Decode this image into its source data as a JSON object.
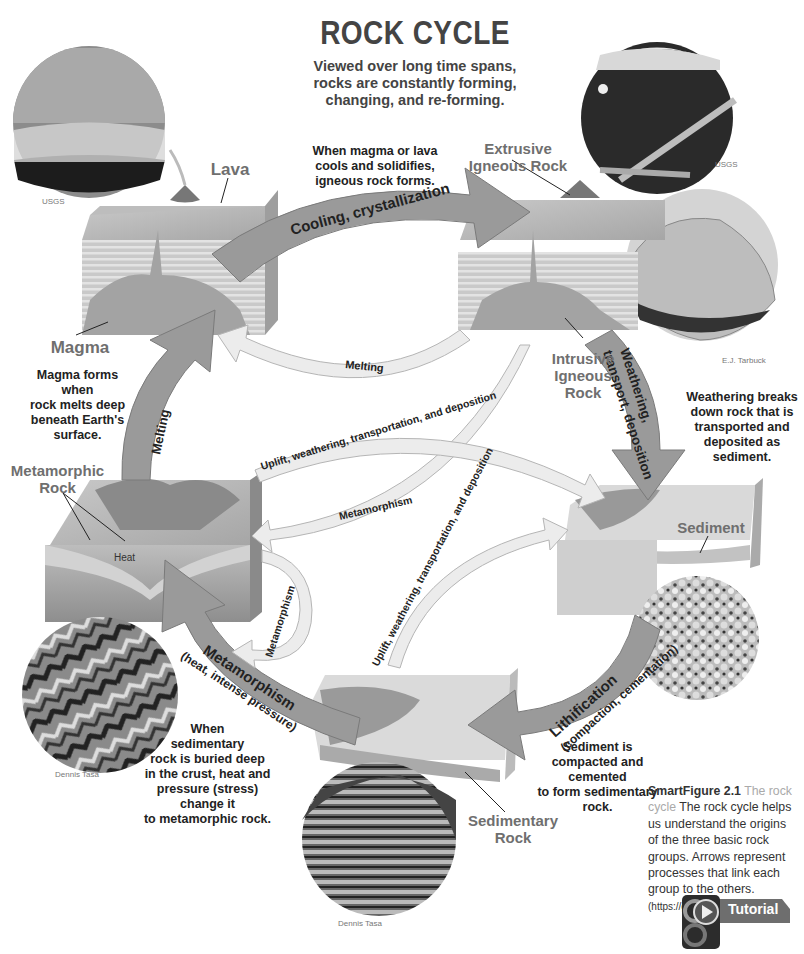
{
  "header": {
    "title": "ROCK CYCLE",
    "subtitle_lines": [
      "Viewed over long time spans,",
      "rocks are constantly forming,",
      "changing, and re-forming."
    ]
  },
  "rock_labels": {
    "lava": "Lava",
    "magma": "Magma",
    "extrusive_line1": "Extrusive",
    "extrusive_line2": "Igneous Rock",
    "intrusive_line1": "Intrusive",
    "intrusive_line2": "Igneous",
    "intrusive_line3": "Rock",
    "metamorphic_line1": "Metamorphic",
    "metamorphic_line2": "Rock",
    "heat": "Heat",
    "sediment": "Sediment",
    "sedimentary_line1": "Sedimentary",
    "sedimentary_line2": "Rock"
  },
  "processes": {
    "cooling": "Cooling, crystallization",
    "melting_main": "Melting",
    "melting_inner": "Melting",
    "weathering_line1": "Weathering,",
    "weathering_line2": "transport, deposition",
    "uplift_upper": "Uplift, weathering, transportation, and deposition",
    "uplift_lower": "Uplift, weathering, transportation, and deposition",
    "metamorphism_inner": "Metamorphism",
    "metamorphism_loop": "Metamorphism",
    "metamorphism_main": "Metamorphism",
    "metamorphism_main_sub": "(heat, intense pressure)",
    "lithification": "Lithification",
    "lithification_sub": "(compaction, cementation)"
  },
  "notes": {
    "cooling_note": [
      "When magma or lava",
      "cools and solidifies,",
      "igneous rock forms."
    ],
    "magma_note": [
      "Magma forms when",
      "rock melts deep",
      "beneath Earth's",
      "surface."
    ],
    "weathering_note": [
      "Weathering breaks",
      "down rock that is",
      "transported and",
      "deposited as",
      "sediment."
    ],
    "metamorphic_note": [
      "When",
      "sedimentary",
      "rock is buried deep",
      "in the crust, heat and",
      "pressure (stress) change it",
      "to metamorphic rock."
    ],
    "lithification_note": [
      "Sediment is",
      "compacted and cemented",
      "to form sedimentary rock."
    ]
  },
  "credits": {
    "lava_photo": "USGS",
    "extrusive_photo": "USGS",
    "granite_photo": "E.J. Tarbuck",
    "gneiss_photo": "Dennis Tasa",
    "canyon_photo": "Dennis Tasa"
  },
  "caption": {
    "figure": "SmartFigure 2.1",
    "subtitle": "The rock cycle",
    "body": "The rock cycle helps us understand the origins of the three basic rock groups. Arrows represent processes that link each group to the others.",
    "url": "(https://goo.gl/dYWRsL)"
  },
  "tutorial": {
    "label": "Tutorial",
    "icon": "play-icon"
  },
  "colors": {
    "arrow_main": "#9a9a9a",
    "arrow_light": "#e6e6e6",
    "label_gray": "#6f6f6f",
    "text": "#222222"
  }
}
